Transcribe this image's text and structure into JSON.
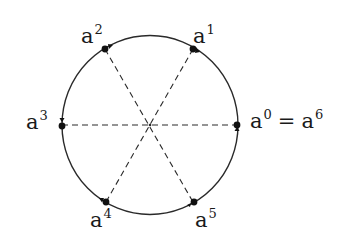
{
  "diagram": {
    "type": "roots-of-unity-circle",
    "center": {
      "x": 150,
      "y": 125
    },
    "radius": 88,
    "stroke_color": "#2a2a2a",
    "points": [
      {
        "id": "a0",
        "base": "a",
        "exp": "0",
        "x": 237,
        "y": 125,
        "label_x": 250,
        "label_y": 111,
        "suffix_eq": "=",
        "suffix_base": "a",
        "suffix_exp": "6"
      },
      {
        "id": "a1",
        "base": "a",
        "exp": "1",
        "x": 193,
        "y": 49,
        "label_x": 194,
        "label_y": 26
      },
      {
        "id": "a2",
        "base": "a",
        "exp": "2",
        "x": 105,
        "y": 49,
        "label_x": 81,
        "label_y": 26
      },
      {
        "id": "a3",
        "base": "a",
        "exp": "3",
        "x": 62,
        "y": 125,
        "label_x": 26,
        "label_y": 112
      },
      {
        "id": "a4",
        "base": "a",
        "exp": "4",
        "x": 106,
        "y": 202,
        "label_x": 90,
        "label_y": 209
      },
      {
        "id": "a5",
        "base": "a",
        "exp": "5",
        "x": 193,
        "y": 202,
        "label_x": 195,
        "label_y": 209
      }
    ],
    "diameters": [
      {
        "from": "a0",
        "to": "a3",
        "style": "dashed"
      },
      {
        "from": "a1",
        "to": "a4",
        "style": "dashed"
      },
      {
        "from": "a2",
        "to": "a5",
        "style": "dashed"
      }
    ]
  },
  "labels": {
    "a0": {
      "base": "a",
      "exp": "0",
      "eq": "=",
      "base2": "a",
      "exp2": "6"
    },
    "a1": {
      "base": "a",
      "exp": "1"
    },
    "a2": {
      "base": "a",
      "exp": "2"
    },
    "a3": {
      "base": "a",
      "exp": "3"
    },
    "a4": {
      "base": "a",
      "exp": "4"
    },
    "a5": {
      "base": "a",
      "exp": "5"
    }
  }
}
